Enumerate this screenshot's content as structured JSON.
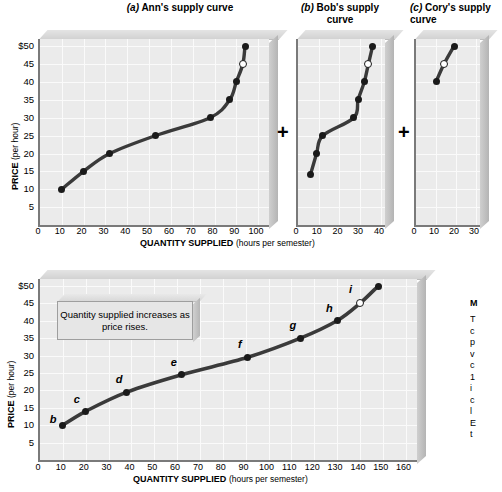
{
  "figure": {
    "axis": {
      "ylabel_main": "PRICE",
      "ylabel_unit": "(per hour)",
      "xlabel_main": "QUANTITY SUPPLIED",
      "xlabel_unit": "(hours per semester)",
      "y_ticks": [
        "$50",
        "45",
        "40",
        "35",
        "30",
        "25",
        "20",
        "15",
        "10",
        "5"
      ],
      "top_x_ticks_ann": [
        "0",
        "10",
        "20",
        "30",
        "40",
        "50",
        "60",
        "70",
        "80",
        "90",
        "100"
      ],
      "top_x_ticks_bob": [
        "0",
        "10",
        "20",
        "30",
        "40"
      ],
      "top_x_ticks_cory": [
        "0",
        "10",
        "20",
        "30"
      ],
      "bottom_x_ticks": [
        "0",
        "10",
        "20",
        "30",
        "40",
        "50",
        "60",
        "70",
        "80",
        "90",
        "100",
        "110",
        "120",
        "130",
        "140",
        "150",
        "160"
      ]
    },
    "operators": [
      "+",
      "+"
    ],
    "annotation": "Quantity supplied increases as price rises.",
    "right_caption": {
      "heading": "M",
      "lines": [
        "T",
        "c",
        "p",
        "v",
        "c",
        "1",
        "i",
        "c",
        "l",
        "E",
        "t"
      ]
    }
  },
  "chart_data": [
    {
      "type": "line",
      "id": "ann",
      "title_prefix": "(a)",
      "title": "Ann's supply curve",
      "xlabel": "QUANTITY SUPPLIED (hours per semester)",
      "ylabel": "PRICE (per hour)",
      "xlim": [
        0,
        105
      ],
      "ylim": [
        0,
        52
      ],
      "grid": true,
      "x": [
        10,
        20,
        32,
        53,
        78,
        87,
        90,
        93,
        94
      ],
      "y": [
        10,
        15,
        20,
        25,
        30,
        35,
        40,
        45,
        50
      ],
      "open_marker_index": 7
    },
    {
      "type": "line",
      "id": "bob",
      "title_prefix": "(b)",
      "title": "Bob's supply curve",
      "xlabel": "QUANTITY SUPPLIED (hours per semester)",
      "ylabel": "PRICE (per hour)",
      "xlim": [
        0,
        42
      ],
      "ylim": [
        0,
        52
      ],
      "grid": true,
      "x": [
        6,
        9,
        12,
        27,
        29,
        32,
        34,
        36
      ],
      "y": [
        14,
        20,
        25,
        30,
        35,
        40,
        45,
        50
      ],
      "open_marker_index": 6
    },
    {
      "type": "line",
      "id": "cory",
      "title_prefix": "(c)",
      "title": "Cory's supply curve",
      "xlabel": "QUANTITY SUPPLIED (hours per semester)",
      "ylabel": "PRICE (per hour)",
      "xlim": [
        0,
        32
      ],
      "ylim": [
        0,
        52
      ],
      "grid": true,
      "x": [
        10,
        14,
        19
      ],
      "y": [
        40,
        45,
        50
      ],
      "open_marker_index": 1
    },
    {
      "type": "line",
      "id": "market",
      "title": "Market supply curve",
      "xlabel": "QUANTITY SUPPLIED (hours per semester)",
      "ylabel": "PRICE (per hour)",
      "xlim": [
        0,
        165
      ],
      "ylim": [
        0,
        52
      ],
      "grid": true,
      "x": [
        10,
        20,
        38,
        62,
        91,
        114,
        130,
        140,
        148
      ],
      "y": [
        10,
        14,
        19.5,
        24.5,
        29.5,
        35,
        40,
        45,
        50
      ],
      "point_labels": [
        "b",
        "c",
        "d",
        "e",
        "f",
        "g",
        "h",
        "i",
        "j"
      ],
      "open_marker_index": 7,
      "annotation": "Quantity supplied increases as price rises."
    }
  ]
}
